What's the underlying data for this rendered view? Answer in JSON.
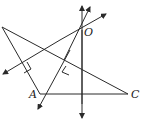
{
  "diagram": {
    "labels": {
      "O": "O",
      "A": "A",
      "C": "C"
    },
    "points": {
      "B": [
        2,
        27
      ],
      "O": [
        82,
        29
      ],
      "A": [
        40,
        94
      ],
      "C": [
        128,
        94
      ]
    },
    "colors": {
      "stroke": "#2a2a2a",
      "background": "#ffffff"
    }
  }
}
